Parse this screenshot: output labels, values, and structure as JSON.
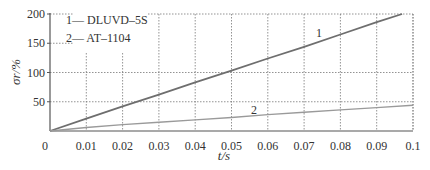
{
  "chart_data": {
    "type": "line",
    "title": "",
    "xlabel": "t/s",
    "ylabel": "σr/%",
    "xlim": [
      0,
      0.1
    ],
    "ylim": [
      0,
      200
    ],
    "x_ticks": [
      "0",
      "0.01",
      "0.02",
      "0.03",
      "0.04",
      "0.05",
      "0.06",
      "0.07",
      "0.08",
      "0.09",
      "0.1"
    ],
    "y_ticks": [
      "50",
      "100",
      "150",
      "200"
    ],
    "grid": true,
    "legend_position": "upper-left",
    "legend": [
      "1— DLUVD–5S",
      "2— AT–1104"
    ],
    "series": [
      {
        "name": "DLUVD-5S",
        "label": "1",
        "color": "#6e6e6e",
        "x": [
          0,
          0.01,
          0.02,
          0.03,
          0.04,
          0.05,
          0.06,
          0.07,
          0.08,
          0.09,
          0.097
        ],
        "y": [
          0,
          21,
          42,
          62,
          83,
          103,
          124,
          144,
          165,
          186,
          200
        ]
      },
      {
        "name": "AT-1104",
        "label": "2",
        "color": "#9a9a9a",
        "x": [
          0,
          0.01,
          0.02,
          0.03,
          0.04,
          0.05,
          0.06,
          0.07,
          0.08,
          0.09,
          0.1
        ],
        "y": [
          0,
          6,
          11,
          15,
          19,
          23,
          28,
          32,
          36,
          40,
          44
        ]
      }
    ]
  }
}
